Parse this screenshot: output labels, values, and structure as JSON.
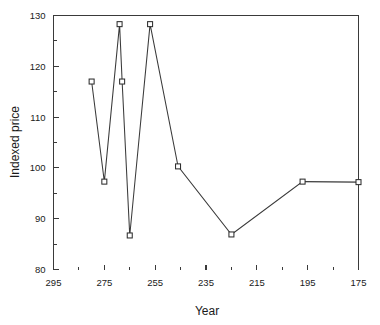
{
  "chart_data": {
    "type": "line",
    "title": "",
    "xlabel": "Year",
    "ylabel": "Indexed price",
    "xlim": [
      295,
      175
    ],
    "ylim": [
      80,
      130
    ],
    "x_reversed": true,
    "grid": false,
    "legend": null,
    "x_tick_labels": [
      "295",
      "275",
      "255",
      "235",
      "215",
      "195",
      "175"
    ],
    "x_tick_values": [
      295,
      275,
      255,
      235,
      215,
      195,
      175
    ],
    "x_minor_tick_values": [
      285,
      265,
      245,
      225,
      205,
      185
    ],
    "y_tick_labels": [
      "80",
      "90",
      "100",
      "110",
      "120",
      "130"
    ],
    "y_tick_values": [
      80,
      90,
      100,
      110,
      120,
      130
    ],
    "y_minor_tick_values": [
      85,
      95,
      105,
      115,
      125
    ],
    "x": [
      280,
      275,
      269,
      268,
      265,
      257,
      246,
      225,
      197,
      175
    ],
    "values": [
      117.0,
      97.3,
      128.3,
      117.0,
      86.7,
      128.3,
      100.3,
      86.9,
      97.3,
      97.2
    ],
    "marker": "open-square",
    "marker_size": 5,
    "series": [
      {
        "name": "Indexed price",
        "points": [
          {
            "x": 280,
            "y": 117.0
          },
          {
            "x": 275,
            "y": 97.3
          },
          {
            "x": 269,
            "y": 128.3
          },
          {
            "x": 268,
            "y": 117.0
          },
          {
            "x": 265,
            "y": 86.7
          },
          {
            "x": 257,
            "y": 128.3
          },
          {
            "x": 246,
            "y": 100.3
          },
          {
            "x": 225,
            "y": 86.9
          },
          {
            "x": 197,
            "y": 97.3
          },
          {
            "x": 175,
            "y": 97.2
          }
        ]
      }
    ],
    "colors": {
      "line": "#3a3a3a",
      "marker_fill": "#ffffff",
      "marker_stroke": "#2e2e2e",
      "axis": "#3a3a3a",
      "text": "#1a1a1a",
      "background": "#ffffff"
    }
  }
}
